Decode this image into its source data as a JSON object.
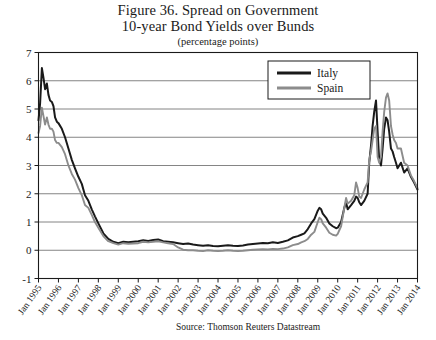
{
  "figure": {
    "title_line1": "Figure 36. Spread on Government",
    "title_line2": "10-year Bond Yields over Bunds",
    "subtitle": "(percentage points)",
    "source": "Source: Thomson Reuters Datastream"
  },
  "legend": {
    "position": "top-right",
    "entries": [
      {
        "label": "Italy",
        "color": "#1a1a1a"
      },
      {
        "label": "Spain",
        "color": "#8c8c8c"
      }
    ]
  },
  "chart_data": {
    "type": "line",
    "title": "Figure 36. Spread on Government 10-year Bond Yields over Bunds",
    "subtitle": "(percentage points)",
    "xlabel": "",
    "ylabel": "",
    "ylim": [
      -1,
      7
    ],
    "yticks": [
      -1,
      0,
      1,
      2,
      3,
      4,
      5,
      6,
      7
    ],
    "ytick_labels": [
      "-1",
      "0",
      "1",
      "2",
      "3",
      "4",
      "5",
      "6",
      "7"
    ],
    "grid": true,
    "xlim": [
      "Jan 1995",
      "Jan 2014"
    ],
    "xtick_labels": [
      "Jan 1995",
      "Jan 1996",
      "Jan 1997",
      "Jan 1998",
      "Jan 1999",
      "Jan 2000",
      "Jan 2001",
      "Jan 2002",
      "Jan 2003",
      "Jan 2004",
      "Jan 2005",
      "Jan 2006",
      "Jan 2007",
      "Jan 2008",
      "Jan 2009",
      "Jan 2010",
      "Jan 2011",
      "Jan 2012",
      "Jan 2013",
      "Jan 2014"
    ],
    "x": [
      1995.0,
      1995.08,
      1995.17,
      1995.25,
      1995.33,
      1995.42,
      1995.5,
      1995.58,
      1995.67,
      1995.75,
      1995.83,
      1995.92,
      1996.0,
      1996.17,
      1996.33,
      1996.5,
      1996.67,
      1996.83,
      1997.0,
      1997.17,
      1997.33,
      1997.5,
      1997.67,
      1997.83,
      1998.0,
      1998.25,
      1998.5,
      1998.75,
      1999.0,
      1999.25,
      1999.5,
      1999.75,
      2000.0,
      2000.25,
      2000.5,
      2000.75,
      2001.0,
      2001.25,
      2001.5,
      2001.75,
      2002.0,
      2002.25,
      2002.5,
      2002.75,
      2003.0,
      2003.25,
      2003.5,
      2003.75,
      2004.0,
      2004.25,
      2004.5,
      2004.75,
      2005.0,
      2005.25,
      2005.5,
      2005.75,
      2006.0,
      2006.25,
      2006.5,
      2006.75,
      2007.0,
      2007.25,
      2007.5,
      2007.75,
      2008.0,
      2008.17,
      2008.33,
      2008.5,
      2008.67,
      2008.83,
      2009.0,
      2009.08,
      2009.17,
      2009.25,
      2009.42,
      2009.58,
      2009.75,
      2009.92,
      2010.0,
      2010.17,
      2010.33,
      2010.42,
      2010.5,
      2010.67,
      2010.83,
      2010.92,
      2011.0,
      2011.08,
      2011.17,
      2011.33,
      2011.5,
      2011.58,
      2011.67,
      2011.75,
      2011.83,
      2011.92,
      2012.0,
      2012.08,
      2012.17,
      2012.25,
      2012.33,
      2012.42,
      2012.5,
      2012.58,
      2012.67,
      2012.75,
      2012.83,
      2012.92,
      2013.0,
      2013.17,
      2013.33,
      2013.5,
      2013.67,
      2013.83,
      2014.0
    ],
    "series": [
      {
        "name": "Italy",
        "color": "#1a1a1a",
        "values": [
          4.6,
          5.2,
          6.45,
          6.1,
          5.7,
          5.9,
          5.5,
          5.3,
          5.25,
          5.1,
          4.7,
          4.55,
          4.5,
          4.3,
          4.0,
          3.6,
          3.2,
          2.9,
          2.6,
          2.35,
          1.95,
          1.75,
          1.45,
          1.2,
          0.95,
          0.6,
          0.4,
          0.3,
          0.25,
          0.3,
          0.28,
          0.3,
          0.32,
          0.35,
          0.33,
          0.36,
          0.38,
          0.32,
          0.3,
          0.28,
          0.25,
          0.22,
          0.24,
          0.2,
          0.18,
          0.16,
          0.18,
          0.15,
          0.14,
          0.16,
          0.18,
          0.16,
          0.15,
          0.17,
          0.2,
          0.22,
          0.24,
          0.26,
          0.25,
          0.28,
          0.26,
          0.3,
          0.35,
          0.45,
          0.5,
          0.55,
          0.6,
          0.75,
          0.95,
          1.1,
          1.4,
          1.5,
          1.45,
          1.3,
          1.15,
          0.95,
          0.85,
          0.78,
          0.8,
          1.0,
          1.5,
          1.7,
          1.45,
          1.6,
          1.75,
          1.9,
          1.85,
          1.7,
          1.6,
          1.75,
          2.0,
          3.1,
          3.7,
          4.4,
          4.9,
          5.3,
          4.2,
          3.2,
          3.0,
          3.6,
          4.3,
          4.7,
          4.6,
          4.2,
          3.6,
          3.5,
          3.3,
          3.1,
          2.9,
          3.1,
          2.75,
          2.9,
          2.6,
          2.4,
          2.15
        ]
      },
      {
        "name": "Spain",
        "color": "#8c8c8c",
        "values": [
          4.15,
          4.4,
          5.05,
          4.75,
          4.45,
          4.7,
          4.45,
          4.3,
          4.3,
          4.2,
          3.9,
          3.8,
          3.8,
          3.65,
          3.4,
          3.0,
          2.7,
          2.5,
          2.2,
          1.95,
          1.6,
          1.5,
          1.25,
          1.0,
          0.8,
          0.5,
          0.32,
          0.25,
          0.2,
          0.25,
          0.23,
          0.24,
          0.25,
          0.3,
          0.28,
          0.3,
          0.32,
          0.28,
          0.25,
          0.22,
          0.1,
          0.02,
          0.0,
          0.0,
          -0.02,
          -0.03,
          0.0,
          -0.02,
          -0.03,
          -0.02,
          0.0,
          -0.02,
          -0.03,
          -0.02,
          0.0,
          0.02,
          0.03,
          0.04,
          0.03,
          0.05,
          0.04,
          0.06,
          0.1,
          0.18,
          0.22,
          0.28,
          0.32,
          0.4,
          0.55,
          0.65,
          1.0,
          1.15,
          1.1,
          0.95,
          0.8,
          0.62,
          0.55,
          0.52,
          0.58,
          0.85,
          1.5,
          1.85,
          1.65,
          1.75,
          1.95,
          2.4,
          2.2,
          1.9,
          1.85,
          2.15,
          2.4,
          3.2,
          3.5,
          3.9,
          4.3,
          4.4,
          3.3,
          3.1,
          3.3,
          4.2,
          4.9,
          5.4,
          5.55,
          5.3,
          4.4,
          4.1,
          3.9,
          3.8,
          3.6,
          3.6,
          3.1,
          3.0,
          2.65,
          2.45,
          2.2
        ]
      }
    ]
  }
}
